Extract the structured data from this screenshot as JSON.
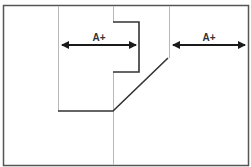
{
  "diagram": {
    "colors": {
      "background": "#ffffff",
      "border": "#555555",
      "thin_line": "#b8b8b8",
      "bold_line": "#333333",
      "arrow": "#1a1a1a",
      "label": "#333333"
    },
    "arrows": [
      {
        "label": "A+",
        "x1": 59,
        "x2": 138,
        "y": 45
      },
      {
        "label": "A+",
        "x1": 170,
        "x2": 247,
        "y": 45
      }
    ]
  }
}
